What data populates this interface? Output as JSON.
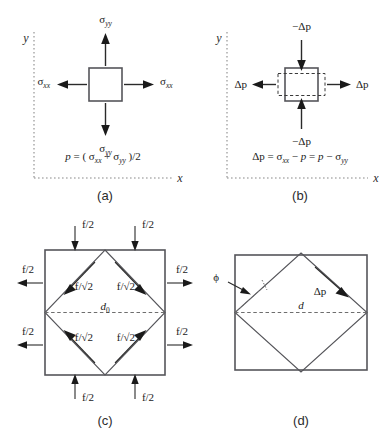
{
  "figure": {
    "type": "scientific-diagram",
    "panels": [
      {
        "id": "a",
        "label": "(a)",
        "axes": {
          "x": "x",
          "y": "y"
        },
        "element_shape": "square",
        "arrows": [
          {
            "name": "sigma-yy-top",
            "label": "σ",
            "sub": "yy",
            "direction": "up"
          },
          {
            "name": "sigma-yy-bottom",
            "label": "σ",
            "sub": "yy",
            "direction": "down"
          },
          {
            "name": "sigma-xx-left",
            "label": "σ",
            "sub": "xx",
            "direction": "left"
          },
          {
            "name": "sigma-xx-right",
            "label": "σ",
            "sub": "xx",
            "direction": "right"
          }
        ],
        "equation": {
          "lhs": "p",
          "eq": "=",
          "open": "( ",
          "term1": "σ",
          "term1_sub": "xx",
          "plus": "+",
          "term2": "σ",
          "term2_sub": "yy",
          "close": " )/2"
        }
      },
      {
        "id": "b",
        "label": "(b)",
        "axes": {
          "x": "x",
          "y": "y"
        },
        "element_shape": "square-with-dashed-deformed-rectangle",
        "arrows": [
          {
            "name": "neg-delta-p-top",
            "label": "−Δp",
            "direction": "down"
          },
          {
            "name": "neg-delta-p-bottom",
            "label": "−Δp",
            "direction": "up"
          },
          {
            "name": "delta-p-left",
            "label": "Δp",
            "direction": "left"
          },
          {
            "name": "delta-p-right",
            "label": "Δp",
            "direction": "right"
          }
        ],
        "equation": {
          "lhs": "Δp",
          "eq1": "=",
          "term1": "σ",
          "term1_sub": "xx",
          "minus1": "−",
          "term2": "p",
          "eq2": "=",
          "term3": "p",
          "minus2": "−",
          "term4": "σ",
          "term4_sub": "yy"
        }
      },
      {
        "id": "c",
        "label": "(c)",
        "element_shape": "square-with-inscribed-diamond",
        "diagonal_label": "d",
        "diagonal_sub": "0",
        "edge_force_label": "f/√2",
        "boundary_force_label": "f/2",
        "edge_forces": [
          {
            "name": "edge-force-top-left",
            "label": "f/√2"
          },
          {
            "name": "edge-force-top-right",
            "label": "f/√2"
          },
          {
            "name": "edge-force-bottom-left",
            "label": "f/√2"
          },
          {
            "name": "edge-force-bottom-right",
            "label": "f/√2"
          }
        ],
        "boundary_forces": [
          {
            "name": "force-top-left",
            "label": "f/2",
            "direction": "down"
          },
          {
            "name": "force-top-right",
            "label": "f/2",
            "direction": "down"
          },
          {
            "name": "force-bottom-left",
            "label": "f/2",
            "direction": "up"
          },
          {
            "name": "force-bottom-right",
            "label": "f/2",
            "direction": "up"
          },
          {
            "name": "force-left-upper",
            "label": "f/2",
            "direction": "left"
          },
          {
            "name": "force-left-lower",
            "label": "f/2",
            "direction": "left"
          },
          {
            "name": "force-right-upper",
            "label": "f/2",
            "direction": "right"
          },
          {
            "name": "force-right-lower",
            "label": "f/2",
            "direction": "right"
          }
        ]
      },
      {
        "id": "d",
        "label": "(d)",
        "element_shape": "rectangle-with-rotated-diamond",
        "diagonal_label": "d",
        "angle_label": "ϕ",
        "stress_label": "Δp"
      }
    ],
    "colors": {
      "background": "#ffffff",
      "stroke_shape": "#55555a",
      "stroke_arrow": "#1a1a1a",
      "stroke_axis": "#8a8a8a",
      "text": "#1a1a1a"
    }
  }
}
